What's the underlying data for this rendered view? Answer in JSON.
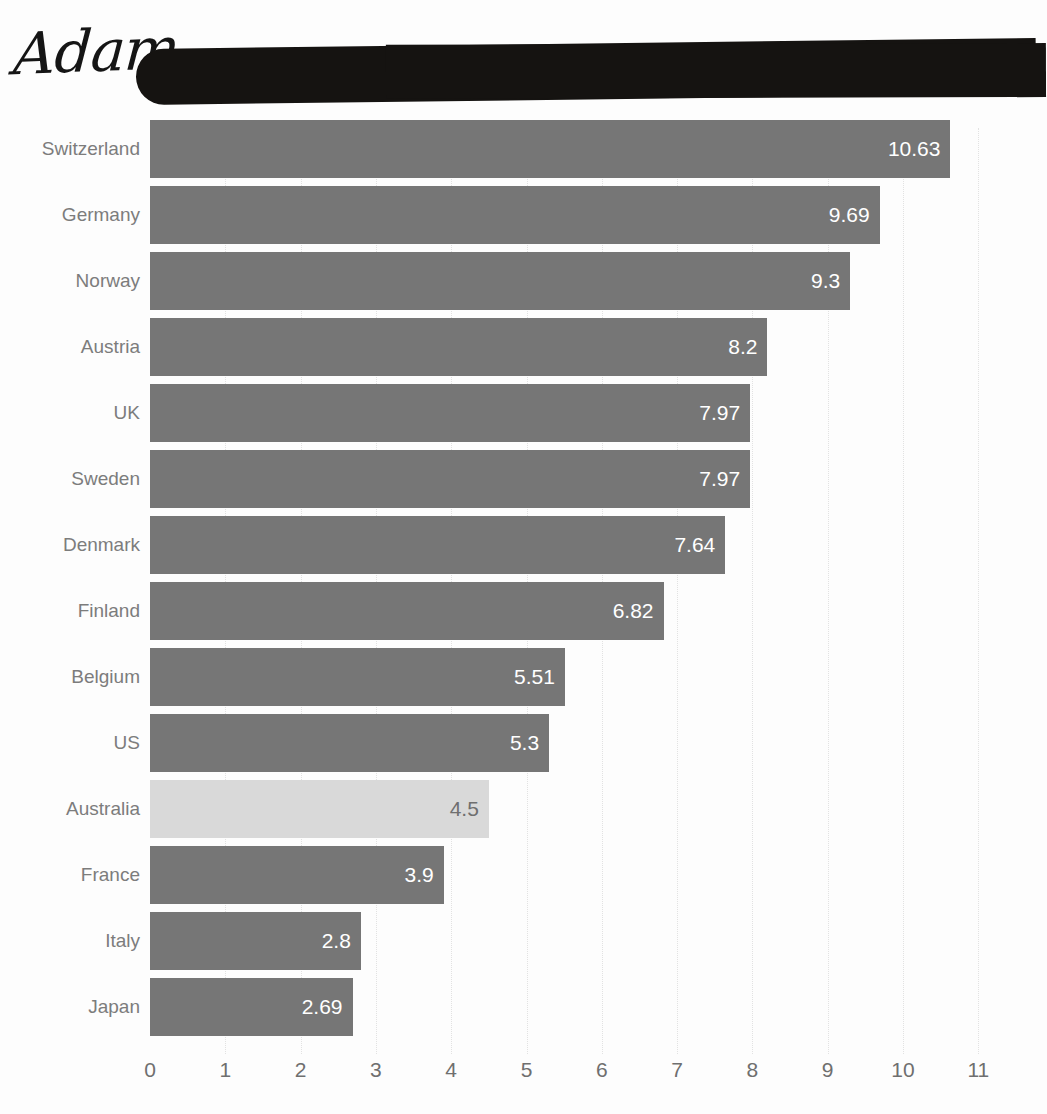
{
  "annotation": {
    "signature_text": "Adam",
    "redaction_label": "redacted-title-bar"
  },
  "chart_data": {
    "type": "bar",
    "orientation": "horizontal",
    "title": "",
    "xlabel": "",
    "ylabel": "",
    "xlim": [
      0,
      11
    ],
    "xticks": [
      "0",
      "1",
      "2",
      "3",
      "4",
      "5",
      "6",
      "7",
      "8",
      "9",
      "10",
      "11"
    ],
    "grid": true,
    "legend": "none",
    "categories": [
      "Switzerland",
      "Germany",
      "Norway",
      "Austria",
      "UK",
      "Sweden",
      "Denmark",
      "Finland",
      "Belgium",
      "US",
      "Australia",
      "France",
      "Italy",
      "Japan"
    ],
    "values": [
      10.63,
      9.69,
      9.3,
      8.2,
      7.97,
      7.97,
      7.64,
      6.82,
      5.51,
      5.3,
      4.5,
      3.9,
      2.8,
      2.69
    ],
    "value_labels": [
      "10.63",
      "9.69",
      "9.3",
      "8.2",
      "7.97",
      "7.97",
      "7.64",
      "6.82",
      "5.51",
      "5.3",
      "4.5",
      "3.9",
      "2.8",
      "2.69"
    ],
    "highlighted_category": "Australia",
    "colors": {
      "bar": "#767676",
      "bar_highlight": "#d9d9d9",
      "value_text": "#ffffff",
      "value_text_highlight": "#6f6f6f",
      "category_label": "#7c7c7c",
      "tick_label": "#6f6f6f",
      "gridline": "#e2e2e2",
      "background": "#fdfdfd",
      "redaction": "#151311",
      "signature": "#151515"
    }
  }
}
